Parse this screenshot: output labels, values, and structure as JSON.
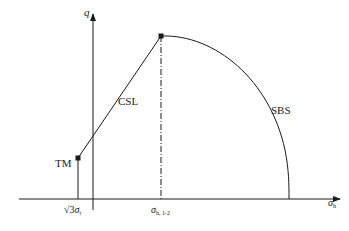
{
  "diagram": {
    "axes": {
      "y_label": "q",
      "x_label": "σ",
      "x_label_sub": "h"
    },
    "curves": {
      "csl_label": "CSL",
      "tm_label": "TM",
      "sbs_label": "SBS"
    },
    "ticks": {
      "left_tick_prefix": "√3",
      "left_tick_sigma": "σ",
      "left_tick_sub": "t",
      "mid_tick_sigma": "σ",
      "mid_tick_sub": "h, 1-2"
    },
    "colors": {
      "line": "#1a1a1a",
      "background": "#ffffff"
    }
  }
}
